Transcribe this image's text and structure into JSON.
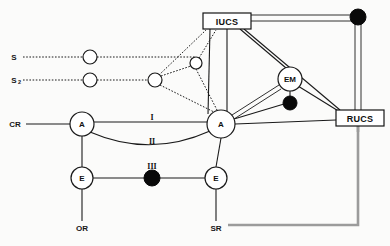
{
  "diagram": {
    "canvas": {
      "width": 390,
      "height": 246,
      "background": "#fbfbfa"
    },
    "colors": {
      "line": "#1a1a1a",
      "filled_node": "#090909",
      "open_node_fill": "#ffffff",
      "gray_line": "#9b9b9b",
      "text": "#111111"
    },
    "boxes": [
      {
        "id": "iucs",
        "label": "IUCS",
        "x": 203,
        "y": 13,
        "w": 48,
        "h": 16
      },
      {
        "id": "rucs",
        "label": "RUCS",
        "x": 336,
        "y": 110,
        "w": 48,
        "h": 16
      }
    ],
    "nodes": [
      {
        "id": "s-relay-1",
        "label": "",
        "type": "open",
        "cx": 90,
        "cy": 57,
        "r": 7
      },
      {
        "id": "s-relay-2",
        "label": "",
        "type": "open",
        "cx": 90,
        "cy": 80,
        "r": 7
      },
      {
        "id": "junction-mid",
        "label": "",
        "type": "open",
        "cx": 155,
        "cy": 80,
        "r": 7
      },
      {
        "id": "junction-upper",
        "label": "",
        "type": "open",
        "cx": 196,
        "cy": 63,
        "r": 6
      },
      {
        "id": "node-a-left",
        "label": "A",
        "type": "open",
        "cx": 82,
        "cy": 124,
        "r": 12
      },
      {
        "id": "node-a-center",
        "label": "A",
        "type": "open",
        "cx": 221,
        "cy": 124,
        "r": 14
      },
      {
        "id": "node-em",
        "label": "EM",
        "type": "open",
        "cx": 290,
        "cy": 79,
        "r": 12
      },
      {
        "id": "node-e-left",
        "label": "E",
        "type": "open",
        "cx": 82,
        "cy": 178,
        "r": 11
      },
      {
        "id": "node-e-right",
        "label": "E",
        "type": "open",
        "cx": 216,
        "cy": 178,
        "r": 11
      },
      {
        "id": "dot-em",
        "label": "",
        "type": "filled",
        "cx": 290,
        "cy": 103,
        "r": 7
      },
      {
        "id": "dot-top-right",
        "label": "",
        "type": "filled",
        "cx": 358,
        "cy": 17,
        "r": 8
      },
      {
        "id": "dot-iii",
        "label": "",
        "type": "filled",
        "cx": 152,
        "cy": 178,
        "r": 8
      }
    ],
    "terminals": [
      {
        "id": "terminal-s",
        "label": "S",
        "subscript": "",
        "x": 14,
        "y": 57
      },
      {
        "id": "terminal-s2",
        "label": "S",
        "subscript": "2",
        "x": 14,
        "y": 80
      },
      {
        "id": "terminal-cr",
        "label": "CR",
        "x": 15,
        "y": 124
      },
      {
        "id": "terminal-or",
        "label": "OR",
        "x": 82,
        "y": 228
      },
      {
        "id": "terminal-sr",
        "label": "SR",
        "x": 216,
        "y": 228
      }
    ],
    "edge_labels": [
      {
        "id": "roman-i",
        "label": "I",
        "x": 152,
        "y": 119
      },
      {
        "id": "roman-ii",
        "label": "II",
        "x": 152,
        "y": 141
      },
      {
        "id": "roman-iii",
        "label": "III",
        "x": 152,
        "y": 166
      }
    ],
    "edge_styles": {
      "dotted": "dotted-edge",
      "solid": "solid-edge",
      "thin": "thin-edge",
      "gray": "gray-edge"
    }
  }
}
